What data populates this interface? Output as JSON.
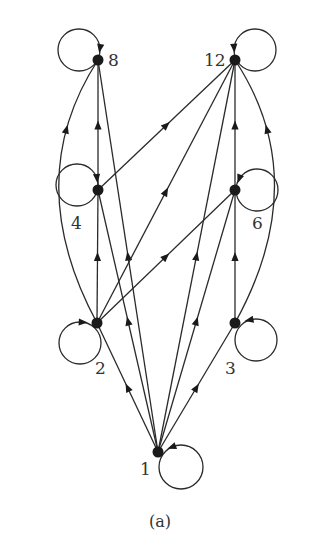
{
  "diagram": {
    "type": "directed-graph",
    "caption": "(a)",
    "nodes": [
      {
        "id": "1",
        "label": "1",
        "x": 158,
        "y": 452,
        "lx": 140,
        "ly": 475,
        "loop": {
          "cx": 181,
          "cy": 467,
          "r": 22
        }
      },
      {
        "id": "2",
        "label": "2",
        "x": 97,
        "y": 323,
        "lx": 95,
        "ly": 374,
        "loop": {
          "cx": 80,
          "cy": 343,
          "r": 21
        }
      },
      {
        "id": "3",
        "label": "3",
        "x": 235,
        "y": 323,
        "lx": 225,
        "ly": 374,
        "loop": {
          "cx": 256,
          "cy": 340,
          "r": 21
        }
      },
      {
        "id": "4",
        "label": "4",
        "x": 98,
        "y": 190,
        "lx": 71,
        "ly": 229,
        "loop": {
          "cx": 77,
          "cy": 185,
          "r": 21
        }
      },
      {
        "id": "6",
        "label": "6",
        "x": 235,
        "y": 190,
        "lx": 252,
        "ly": 229,
        "loop": {
          "cx": 257,
          "cy": 190,
          "r": 21
        }
      },
      {
        "id": "8",
        "label": "8",
        "x": 98,
        "y": 60,
        "lx": 108,
        "ly": 66,
        "loop": {
          "cx": 79,
          "cy": 50,
          "r": 21
        }
      },
      {
        "id": "12",
        "label": "12",
        "x": 235,
        "y": 60,
        "lx": 204,
        "ly": 66,
        "loop": {
          "cx": 255,
          "cy": 50,
          "r": 21
        }
      }
    ],
    "edges": [
      {
        "from": "1",
        "to": "2"
      },
      {
        "from": "1",
        "to": "3"
      },
      {
        "from": "1",
        "to": "4"
      },
      {
        "from": "1",
        "to": "6"
      },
      {
        "from": "1",
        "to": "8"
      },
      {
        "from": "1",
        "to": "12"
      },
      {
        "from": "2",
        "to": "4"
      },
      {
        "from": "2",
        "to": "6"
      },
      {
        "from": "2",
        "to": "8",
        "curved": true,
        "ctrl": [
          20,
          180
        ]
      },
      {
        "from": "2",
        "to": "12"
      },
      {
        "from": "3",
        "to": "6"
      },
      {
        "from": "3",
        "to": "12",
        "curved": true,
        "ctrl": [
          314,
          180
        ]
      },
      {
        "from": "4",
        "to": "8"
      },
      {
        "from": "4",
        "to": "12"
      },
      {
        "from": "6",
        "to": "12"
      }
    ],
    "self_loops": [
      "1",
      "2",
      "3",
      "4",
      "6",
      "8",
      "12"
    ]
  }
}
